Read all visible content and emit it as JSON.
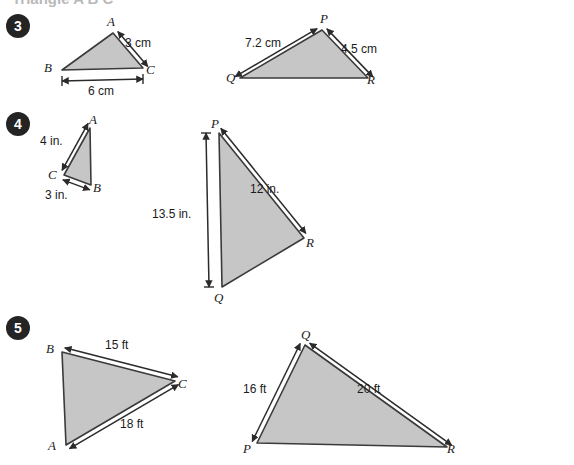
{
  "page": {
    "width": 574,
    "height": 465,
    "background": "#ffffff",
    "header_partial_text": "Triangle A B C",
    "fill_color": "#c6c6c6",
    "stroke_color": "#3a3a3a",
    "badge_color": "#242424",
    "text_color": "#1b1b1b"
  },
  "problems": [
    {
      "number": "3",
      "badge": {
        "x": 18,
        "y": 26
      },
      "units": "cm",
      "left_triangle": {
        "name": "triangle-abc",
        "vertices": [
          {
            "label": "A",
            "x": 113,
            "y": 33,
            "label_x": 107,
            "label_y": 14
          },
          {
            "label": "B",
            "x": 62,
            "y": 70,
            "label_x": 44,
            "label_y": 60
          },
          {
            "label": "C",
            "x": 143,
            "y": 68,
            "label_x": 146,
            "label_y": 62
          }
        ],
        "measures": [
          {
            "label": "3 cm",
            "x": 125,
            "y": 36,
            "from": "A",
            "to": "C"
          },
          {
            "label": "6 cm",
            "x": 88,
            "y": 84,
            "from": "B",
            "to": "C"
          }
        ]
      },
      "right_triangle": {
        "name": "triangle-pqr",
        "vertices": [
          {
            "label": "P",
            "x": 322,
            "y": 30,
            "label_x": 320,
            "label_y": 11
          },
          {
            "label": "Q",
            "x": 240,
            "y": 78,
            "label_x": 226,
            "label_y": 70
          },
          {
            "label": "R",
            "x": 368,
            "y": 78,
            "label_x": 367,
            "label_y": 72
          }
        ],
        "measures": [
          {
            "label": "7.2 cm",
            "x": 245,
            "y": 36,
            "from": "Q",
            "to": "P"
          },
          {
            "label": "4.5 cm",
            "x": 341,
            "y": 42,
            "from": "P",
            "to": "R"
          }
        ]
      }
    },
    {
      "number": "4",
      "badge": {
        "x": 18,
        "y": 124
      },
      "units": "in.",
      "left_triangle": {
        "name": "triangle-abc",
        "vertices": [
          {
            "label": "A",
            "x": 90,
            "y": 128,
            "label_x": 89,
            "label_y": 112
          },
          {
            "label": "C",
            "x": 64,
            "y": 175,
            "label_x": 48,
            "label_y": 167
          },
          {
            "label": "B",
            "x": 91,
            "y": 185,
            "label_x": 93,
            "label_y": 180
          }
        ],
        "measures": [
          {
            "label": "4 in.",
            "x": 40,
            "y": 134,
            "from": "A",
            "to": "C"
          },
          {
            "label": "3 in.",
            "x": 45,
            "y": 188,
            "from": "C",
            "to": "B"
          }
        ]
      },
      "right_triangle": {
        "name": "triangle-pqr",
        "vertices": [
          {
            "label": "P",
            "x": 219,
            "y": 133,
            "label_x": 211,
            "label_y": 116
          },
          {
            "label": "Q",
            "x": 222,
            "y": 287,
            "label_x": 214,
            "label_y": 290
          },
          {
            "label": "R",
            "x": 304,
            "y": 238,
            "label_x": 306,
            "label_y": 235
          }
        ],
        "measures": [
          {
            "label": "12 in.",
            "x": 250,
            "y": 182,
            "from": "P",
            "to": "R"
          },
          {
            "label": "13.5 in.",
            "x": 152,
            "y": 207,
            "from": "P",
            "to": "Q"
          }
        ]
      }
    },
    {
      "number": "5",
      "badge": {
        "x": 18,
        "y": 328
      },
      "units": "ft",
      "left_triangle": {
        "name": "triangle-abc",
        "vertices": [
          {
            "label": "B",
            "x": 62,
            "y": 352,
            "label_x": 46,
            "label_y": 341
          },
          {
            "label": "C",
            "x": 175,
            "y": 381,
            "label_x": 178,
            "label_y": 376
          },
          {
            "label": "A",
            "x": 66,
            "y": 445,
            "label_x": 48,
            "label_y": 438
          }
        ],
        "measures": [
          {
            "label": "15 ft",
            "x": 105,
            "y": 338,
            "from": "B",
            "to": "C"
          },
          {
            "label": "18 ft",
            "x": 120,
            "y": 417,
            "from": "A",
            "to": "C"
          }
        ]
      },
      "right_triangle": {
        "name": "triangle-pqr",
        "vertices": [
          {
            "label": "Q",
            "x": 305,
            "y": 345,
            "label_x": 301,
            "label_y": 327
          },
          {
            "label": "P",
            "x": 257,
            "y": 443,
            "label_x": 243,
            "label_y": 441
          },
          {
            "label": "R",
            "x": 447,
            "y": 447,
            "label_x": 447,
            "label_y": 441
          }
        ],
        "measures": [
          {
            "label": "16 ft",
            "x": 243,
            "y": 382,
            "from": "P",
            "to": "Q"
          },
          {
            "label": "20 ft",
            "x": 357,
            "y": 382,
            "from": "Q",
            "to": "R"
          }
        ]
      }
    }
  ]
}
